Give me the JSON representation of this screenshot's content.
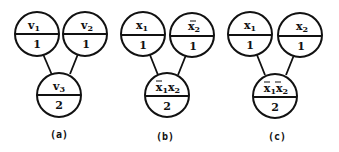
{
  "diagrams": [
    {
      "caption": "(a)",
      "nodes": [
        {
          "id": "v1",
          "var": "v",
          "sub": "1",
          "negated": false,
          "weight": "1"
        },
        {
          "id": "v2",
          "var": "v",
          "sub": "2",
          "negated": false,
          "weight": "1"
        },
        {
          "id": "v3",
          "var": "v",
          "sub": "3",
          "negated": false,
          "weight": "2"
        }
      ],
      "edges": [
        [
          "v1",
          "v3"
        ],
        [
          "v2",
          "v3"
        ]
      ]
    },
    {
      "caption": "(b)",
      "nodes": [
        {
          "id": "x1",
          "var": "x",
          "sub": "1",
          "negated": false,
          "weight": "1"
        },
        {
          "id": "x2bar",
          "var": "x",
          "sub": "2",
          "negated": true,
          "weight": "1"
        },
        {
          "id": "x1bar_x2",
          "terms": [
            {
              "var": "x",
              "sub": "1",
              "negated": true
            },
            {
              "var": "x",
              "sub": "2",
              "negated": false
            }
          ],
          "weight": "2"
        }
      ],
      "edges": [
        [
          "x1",
          "x1bar_x2"
        ],
        [
          "x2bar",
          "x1bar_x2"
        ]
      ]
    },
    {
      "caption": "(c)",
      "nodes": [
        {
          "id": "x1",
          "var": "x",
          "sub": "1",
          "negated": false,
          "weight": "1"
        },
        {
          "id": "x2",
          "var": "x",
          "sub": "2",
          "negated": false,
          "weight": "1"
        },
        {
          "id": "x1bar_x2bar",
          "terms": [
            {
              "var": "x",
              "sub": "1",
              "negated": true
            },
            {
              "var": "x",
              "sub": "2",
              "negated": true
            }
          ],
          "weight": "2"
        }
      ],
      "edges": [
        [
          "x1",
          "x1bar_x2bar"
        ],
        [
          "x2",
          "x1bar_x2bar"
        ]
      ]
    }
  ],
  "labels": {
    "a": {
      "top_left": {
        "var": "v",
        "sub": "1",
        "weight": "1"
      },
      "top_right": {
        "var": "v",
        "sub": "2",
        "weight": "1"
      },
      "bottom": {
        "var": "v",
        "sub": "3",
        "weight": "2"
      },
      "caption": "(a)"
    },
    "b": {
      "top_left": {
        "var": "x",
        "sub": "1",
        "weight": "1"
      },
      "top_right": {
        "var": "x",
        "sub": "2",
        "weight": "1"
      },
      "bottom": {
        "var1": "x",
        "sub1": "1",
        "var2": "x",
        "sub2": "2",
        "weight": "2"
      },
      "caption": "(b)"
    },
    "c": {
      "top_left": {
        "var": "x",
        "sub": "1",
        "weight": "1"
      },
      "top_right": {
        "var": "x",
        "sub": "2",
        "weight": "1"
      },
      "bottom": {
        "var1": "x",
        "sub1": "1",
        "var2": "x",
        "sub2": "2",
        "weight": "2"
      },
      "caption": "(c)"
    }
  }
}
